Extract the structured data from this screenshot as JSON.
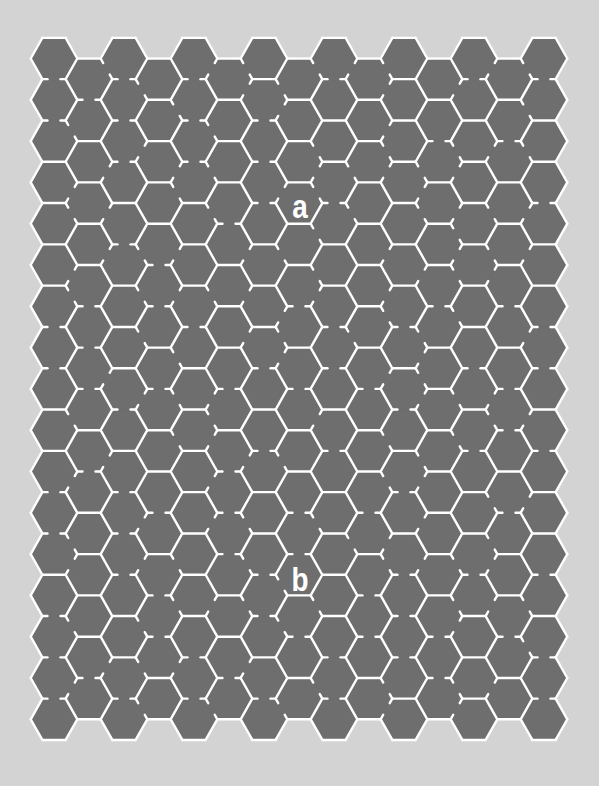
{
  "puzzle": {
    "type": "hexagonal-maze",
    "start_label": "a",
    "end_label": "b",
    "start_pos": {
      "x": 300,
      "y": 206
    },
    "end_pos": {
      "x": 300,
      "y": 579
    }
  },
  "grid": {
    "columns": 15,
    "rows_even_columns": 17,
    "rows_odd_columns": 16,
    "hex_side": 23.3,
    "origin_x": 54,
    "origin_y": 58.5,
    "column_step": 35,
    "row_step": 41.3,
    "orientation": "flat-top",
    "seed": 20240611
  },
  "colors": {
    "background": "#d3d3d3",
    "cell_fill": "#6e6e6e",
    "wall": "#ffffff"
  }
}
